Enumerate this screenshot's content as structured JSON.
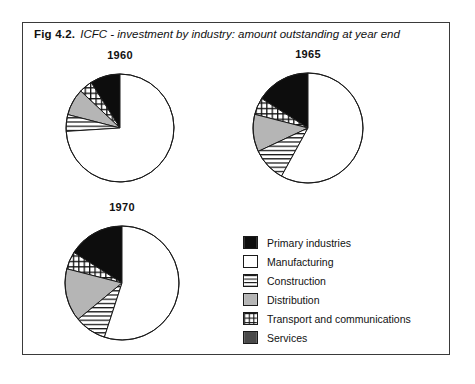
{
  "figure": {
    "label": "Fig 4.2.",
    "caption": "ICFC - investment by industry: amount outstanding at year end"
  },
  "legend": {
    "items": [
      {
        "label": "Primary industries",
        "pattern": "solid-black",
        "color": "#0d0d0d"
      },
      {
        "label": "Manufacturing",
        "pattern": "solid-white",
        "color": "#ffffff"
      },
      {
        "label": "Construction",
        "pattern": "horizontal-lines",
        "color": "#ffffff"
      },
      {
        "label": "Distribution",
        "pattern": "solid-light-grey",
        "color": "#b5b5b5"
      },
      {
        "label": "Transport and communications",
        "pattern": "grid-hatch",
        "color": "#ffffff"
      },
      {
        "label": "Services",
        "pattern": "solid-dark-grey",
        "color": "#4a4a4a"
      }
    ]
  },
  "chart_data": [
    {
      "type": "pie",
      "title": "1960",
      "categories": [
        "Primary industries",
        "Transport and communications",
        "Distribution",
        "Construction",
        "Manufacturing"
      ],
      "values": [
        9,
        4,
        8,
        5,
        74
      ],
      "unit": "percent",
      "start_angle_deg": 90,
      "direction": "counterclockwise",
      "center": {
        "x": 120,
        "y": 128
      },
      "radius": 54,
      "legend_position": "bottom-right"
    },
    {
      "type": "pie",
      "title": "1965",
      "categories": [
        "Primary industries",
        "Transport and communications",
        "Distribution",
        "Construction",
        "Manufacturing"
      ],
      "values": [
        16,
        5,
        11,
        10,
        58
      ],
      "unit": "percent",
      "start_angle_deg": 90,
      "direction": "counterclockwise",
      "center": {
        "x": 308,
        "y": 128
      },
      "radius": 55,
      "legend_position": "bottom-right"
    },
    {
      "type": "pie",
      "title": "1970",
      "categories": [
        "Primary industries",
        "Transport and communications",
        "Distribution",
        "Construction",
        "Manufacturing"
      ],
      "values": [
        16,
        5,
        15,
        9,
        55
      ],
      "unit": "percent",
      "start_angle_deg": 90,
      "direction": "counterclockwise",
      "center": {
        "x": 122,
        "y": 283
      },
      "radius": 57,
      "legend_position": "bottom-right"
    }
  ]
}
